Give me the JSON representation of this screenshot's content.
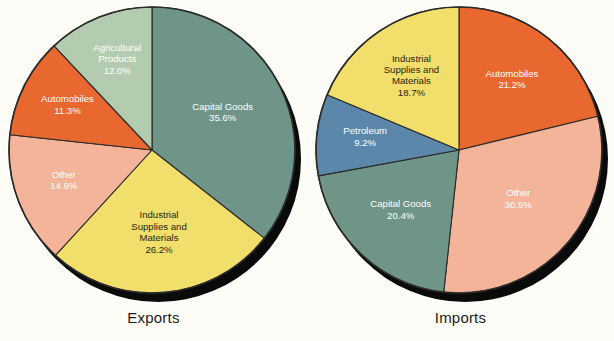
{
  "background_color": "#fdfcf7",
  "shadow_color": "#0a0a0a",
  "palette": {
    "teal": "#6f9488",
    "sage": "#b3ccb0",
    "yellow": "#f2de6a",
    "orange": "#e9682f",
    "salmon": "#f3b49a",
    "blue": "#5b87ab",
    "outline": "#2b2b2b",
    "label_dark": "#231f16",
    "label_light": "#ffffff"
  },
  "charts": [
    {
      "caption": "Exports",
      "type": "pie",
      "title": "Exports",
      "categories": [
        "Capital Goods",
        "Industrial Supplies and Materials",
        "Other",
        "Automobiles",
        "Agricultural Products"
      ],
      "values": [
        35.6,
        26.2,
        14.9,
        11.3,
        12.0
      ],
      "slices": [
        {
          "label": "Capital Goods",
          "value": 35.6,
          "value_text": "35.6%",
          "color": "#6f9488",
          "label_color": "light",
          "lines": [
            "Capital Goods",
            "35.6%"
          ]
        },
        {
          "label": "Industrial Supplies and Materials",
          "value": 26.2,
          "value_text": "26.2%",
          "color": "#f2de6a",
          "label_color": "dark",
          "lines": [
            "Industrial",
            "Supplies and",
            "Materials",
            "26.2%"
          ]
        },
        {
          "label": "Other",
          "value": 14.9,
          "value_text": "14.9%",
          "color": "#f3b49a",
          "label_color": "light",
          "lines": [
            "Other",
            "14.9%"
          ]
        },
        {
          "label": "Automobiles",
          "value": 11.3,
          "value_text": "11.3%",
          "color": "#e9682f",
          "label_color": "light",
          "lines": [
            "Automobiles",
            "11.3%"
          ]
        },
        {
          "label": "Agricultural Products",
          "value": 12.0,
          "value_text": "12.0%",
          "color": "#b3ccb0",
          "label_color": "light",
          "lines": [
            "Agricultural",
            "Products",
            "12.0%"
          ]
        }
      ]
    },
    {
      "caption": "Imports",
      "type": "pie",
      "title": "Imports",
      "categories": [
        "Automobiles",
        "Other",
        "Capital Goods",
        "Petroleum",
        "Industrial Supplies and Materials"
      ],
      "values": [
        21.2,
        30.5,
        20.4,
        9.2,
        18.7
      ],
      "slices": [
        {
          "label": "Automobiles",
          "value": 21.2,
          "value_text": "21.2%",
          "color": "#e9682f",
          "label_color": "light",
          "lines": [
            "Automobiles",
            "21.2%"
          ]
        },
        {
          "label": "Other",
          "value": 30.5,
          "value_text": "30.5%",
          "color": "#f3b49a",
          "label_color": "light",
          "lines": [
            "Other",
            "30.5%"
          ]
        },
        {
          "label": "Capital Goods",
          "value": 20.4,
          "value_text": "20.4%",
          "color": "#6f9488",
          "label_color": "light",
          "lines": [
            "Capital Goods",
            "20.4%"
          ]
        },
        {
          "label": "Petroleum",
          "value": 9.2,
          "value_text": "9.2%",
          "color": "#5b87ab",
          "label_color": "light",
          "lines": [
            "Petroleum",
            "9.2%"
          ]
        },
        {
          "label": "Industrial Supplies and Materials",
          "value": 18.7,
          "value_text": "18.7%",
          "color": "#f2de6a",
          "label_color": "dark",
          "lines": [
            "Industrial",
            "Supplies and",
            "Materials",
            "18.7%"
          ]
        }
      ]
    }
  ],
  "chart_data": [
    {
      "type": "pie",
      "title": "Exports",
      "categories": [
        "Capital Goods",
        "Industrial Supplies and Materials",
        "Other",
        "Automobiles",
        "Agricultural Products"
      ],
      "values": [
        35.6,
        26.2,
        14.9,
        11.3,
        12.0
      ],
      "unit": "percent",
      "total": 100.0,
      "legend": "none",
      "labels_inside_slices": true,
      "start_angle_deg": 0,
      "direction": "clockwise"
    },
    {
      "type": "pie",
      "title": "Imports",
      "categories": [
        "Automobiles",
        "Other",
        "Capital Goods",
        "Petroleum",
        "Industrial Supplies and Materials"
      ],
      "values": [
        21.2,
        30.5,
        20.4,
        9.2,
        18.7
      ],
      "unit": "percent",
      "total": 100.0,
      "legend": "none",
      "labels_inside_slices": true,
      "start_angle_deg": 0,
      "direction": "clockwise"
    }
  ]
}
